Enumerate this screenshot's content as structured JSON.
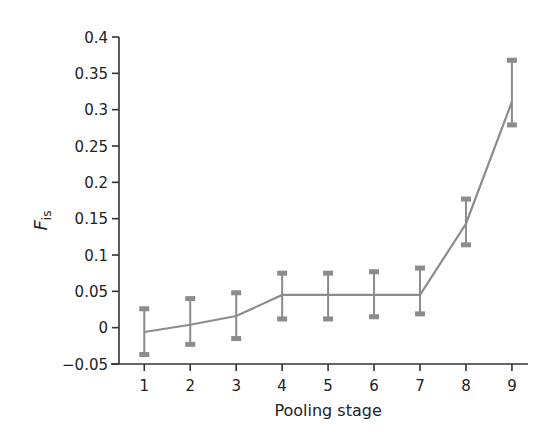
{
  "chart_data": {
    "type": "line",
    "title": "",
    "xlabel": "Pooling stage",
    "ylabel": "F",
    "ylabel_subscript": "is",
    "x": [
      1,
      2,
      3,
      4,
      5,
      6,
      7,
      8,
      9
    ],
    "xticks": [
      "1",
      "2",
      "3",
      "4",
      "5",
      "6",
      "7",
      "8",
      "9"
    ],
    "xlim": [
      0.45,
      9.35
    ],
    "ylim": [
      -0.05,
      0.4
    ],
    "yticks": [
      -0.05,
      0,
      0.05,
      0.1,
      0.15,
      0.2,
      0.25,
      0.3,
      0.35,
      0.4
    ],
    "ytick_labels": [
      "−0.05",
      "0",
      "0.05",
      "0.1",
      "0.15",
      "0.2",
      "0.25",
      "0.3",
      "0.35",
      "0.4"
    ],
    "grid": false,
    "legend": "none",
    "series": [
      {
        "name": "Fis",
        "color": "#8c8c8c",
        "values": [
          -0.006,
          0.004,
          0.016,
          0.045,
          0.045,
          0.045,
          0.045,
          0.143,
          0.311
        ],
        "error_upper": [
          0.026,
          0.04,
          0.048,
          0.075,
          0.075,
          0.077,
          0.082,
          0.177,
          0.368
        ],
        "error_lower": [
          -0.037,
          -0.023,
          -0.015,
          0.012,
          0.012,
          0.015,
          0.019,
          0.114,
          0.279
        ]
      }
    ]
  }
}
